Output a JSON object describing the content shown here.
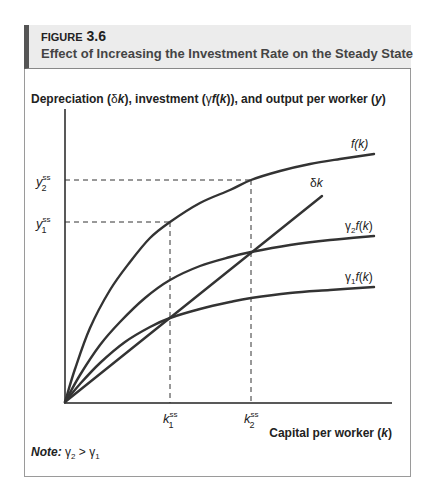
{
  "figure": {
    "number_prefix": "Figure",
    "number": "3.6",
    "title": "Effect of Increasing the Investment Rate on the Steady State"
  },
  "note": {
    "label": "Note:",
    "text": "γ₂ > γ₁"
  },
  "chart_data": {
    "type": "line",
    "title": "Effect of Increasing the Investment Rate on the Steady State",
    "ylabel": "Depreciation (δk), investment (γf(k)), and output per worker (y)",
    "xlabel": "Capital per worker (k)",
    "grid": false,
    "legend": "inline labels at curve ends",
    "series": [
      {
        "name": "f(k)",
        "shape": "concave",
        "pixel_points": [
          [
            65,
            402
          ],
          [
            75,
            369
          ],
          [
            90,
            328
          ],
          [
            110,
            290
          ],
          [
            130,
            262
          ],
          [
            150,
            238
          ],
          [
            170,
            222
          ],
          [
            200,
            203
          ],
          [
            230,
            190
          ],
          [
            251,
            180
          ],
          [
            280,
            171
          ],
          [
            310,
            164
          ],
          [
            340,
            159
          ],
          [
            374,
            154
          ]
        ]
      },
      {
        "name": "γ2f(k)",
        "shape": "concave",
        "pixel_points": [
          [
            65,
            402
          ],
          [
            80,
            375
          ],
          [
            100,
            345
          ],
          [
            120,
            322
          ],
          [
            145,
            298
          ],
          [
            170,
            280
          ],
          [
            200,
            266
          ],
          [
            230,
            257
          ],
          [
            251,
            252
          ],
          [
            290,
            245
          ],
          [
            330,
            240
          ],
          [
            374,
            236
          ]
        ]
      },
      {
        "name": "γ1f(k)",
        "shape": "concave",
        "pixel_points": [
          [
            65,
            402
          ],
          [
            80,
            384
          ],
          [
            100,
            363
          ],
          [
            125,
            342
          ],
          [
            150,
            327
          ],
          [
            170,
            318
          ],
          [
            200,
            309
          ],
          [
            230,
            302
          ],
          [
            251,
            298
          ],
          [
            290,
            293
          ],
          [
            330,
            290
          ],
          [
            374,
            287
          ]
        ]
      },
      {
        "name": "δk",
        "shape": "linear",
        "pixel_points": [
          [
            65,
            402
          ],
          [
            322,
            196
          ]
        ]
      }
    ],
    "x_ticks": [
      {
        "label": "k1ss",
        "x": 170
      },
      {
        "label": "k2ss",
        "x": 251
      }
    ],
    "y_ticks": [
      {
        "label": "y2ss",
        "y": 180
      },
      {
        "label": "y1ss",
        "y": 222
      }
    ],
    "annotations": [
      "f(k)",
      "δk",
      "γ2f(k)",
      "γ1f(k)"
    ],
    "relation": "γ2 > γ1"
  }
}
